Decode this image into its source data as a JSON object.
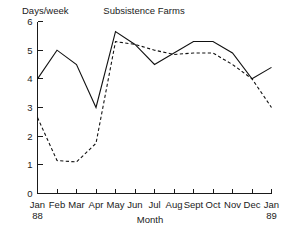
{
  "chart_data": {
    "type": "line",
    "title": "Subsistence Farms",
    "xlabel": "Month",
    "ylabel": "Days/week",
    "grid": false,
    "legend": "none",
    "categories": [
      "Jan",
      "Feb",
      "Mar",
      "Apr",
      "May",
      "Jun",
      "Jul",
      "Aug",
      "Sept",
      "Oct",
      "Nov",
      "Dec",
      "Jan"
    ],
    "category_sublabels": [
      "88",
      "",
      "",
      "",
      "",
      "",
      "",
      "",
      "",
      "",
      "",
      "",
      "89"
    ],
    "ylim": [
      0,
      6
    ],
    "yticks": [
      0,
      1,
      2,
      3,
      4,
      5,
      6
    ],
    "ytick_labels": [
      "0",
      "1",
      "2",
      "3",
      "4",
      "5",
      "6"
    ],
    "xlim_index": [
      0,
      12
    ],
    "series": [
      {
        "name": "solid",
        "style": "solid",
        "values": [
          4.0,
          5.0,
          4.5,
          3.0,
          5.65,
          5.2,
          4.5,
          4.9,
          5.3,
          5.3,
          4.9,
          4.0,
          4.4
        ]
      },
      {
        "name": "dashed",
        "style": "dashed",
        "values": [
          2.65,
          1.15,
          1.1,
          1.75,
          5.3,
          5.2,
          5.0,
          4.85,
          4.9,
          4.9,
          4.5,
          4.0,
          3.0
        ]
      }
    ]
  },
  "colors": {
    "ink": "#1a1a1a",
    "line": "#111111",
    "background": "#ffffff"
  }
}
